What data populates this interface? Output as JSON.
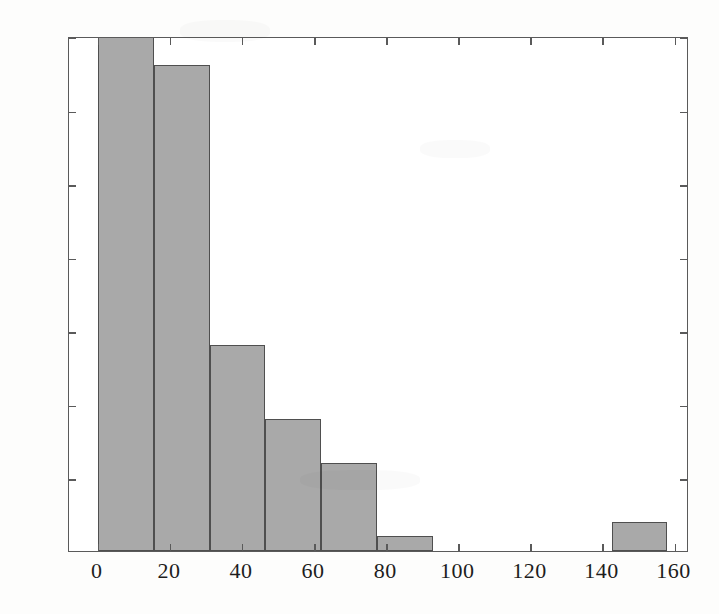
{
  "chart_data": {
    "type": "bar",
    "title": "",
    "subtitle": "",
    "xlabel": "",
    "ylabel": "",
    "xlim": [
      -8,
      164
    ],
    "ylim": [
      0,
      35
    ],
    "grid": false,
    "legend": null,
    "bin_width": 15.5,
    "x_ticks": [
      0,
      20,
      40,
      60,
      80,
      100,
      120,
      140,
      160
    ],
    "x_tick_labels": [
      "0",
      "20",
      "40",
      "60",
      "80",
      "100",
      "120",
      "140",
      "160"
    ],
    "y_ticks": [
      0,
      5,
      10,
      15,
      20,
      25,
      30,
      35
    ],
    "y_tick_labels": [
      "0",
      "5",
      "10",
      "15",
      "20",
      "25",
      "30",
      "35"
    ],
    "bars": [
      {
        "label": "0-15.5",
        "x0": 0.0,
        "x1": 15.5,
        "value": 35,
        "clipped": true
      },
      {
        "label": "15.5-31",
        "x0": 15.5,
        "x1": 31.0,
        "value": 33,
        "clipped": false
      },
      {
        "label": "31-46.5",
        "x0": 31.0,
        "x1": 46.5,
        "value": 14,
        "clipped": false
      },
      {
        "label": "46.5-62",
        "x0": 46.5,
        "x1": 62.0,
        "value": 9,
        "clipped": false
      },
      {
        "label": "62-77.5",
        "x0": 62.0,
        "x1": 77.5,
        "value": 6,
        "clipped": false
      },
      {
        "label": "77.5-93",
        "x0": 77.5,
        "x1": 93.0,
        "value": 1,
        "clipped": false
      },
      {
        "label": "142.5-158",
        "x0": 142.5,
        "x1": 158.0,
        "value": 2,
        "clipped": false
      }
    ],
    "categories": [
      "0-15.5",
      "15.5-31",
      "31-46.5",
      "46.5-62",
      "62-77.5",
      "77.5-93",
      "142.5-158"
    ],
    "values": [
      35,
      33,
      14,
      9,
      6,
      1,
      2
    ]
  },
  "style": {
    "bar_fill": "#a9a9a9",
    "bar_edge": "#4f4f4f",
    "axis_color": "#5a5a5a",
    "text_color": "#1d1d1d",
    "background": "#fdfdfc",
    "plot_background": "#ffffff"
  }
}
